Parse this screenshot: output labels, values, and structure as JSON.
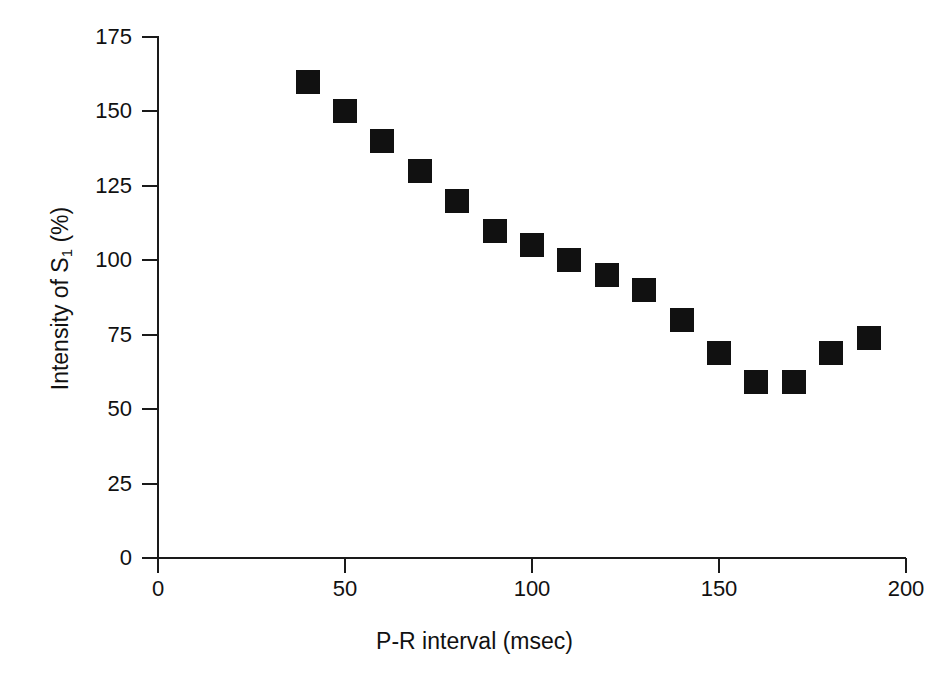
{
  "chart_data": {
    "type": "scatter",
    "title": "",
    "subtitle": "",
    "xlabel": "P-R interval (msec)",
    "ylabel": "Intensity of S1 (%)",
    "ylabel_base": "Intensity of S",
    "ylabel_sub": "1",
    "ylabel_tail": " (%)",
    "xlim": [
      0,
      200
    ],
    "ylim": [
      0,
      175
    ],
    "xticks": [
      0,
      50,
      100,
      150,
      200
    ],
    "yticks": [
      0,
      25,
      50,
      75,
      100,
      125,
      150,
      175
    ],
    "xticklabels": [
      "0",
      "50",
      "100",
      "150",
      "200"
    ],
    "yticklabels": [
      "0",
      "25",
      "50",
      "75",
      "100",
      "125",
      "150",
      "175"
    ],
    "grid": false,
    "legend": null,
    "marker_style": "filled-square",
    "marker_color": "#111111",
    "x": [
      40,
      50,
      60,
      70,
      80,
      90,
      100,
      110,
      120,
      130,
      140,
      150,
      160,
      170,
      180,
      190
    ],
    "values": [
      160,
      150,
      140,
      130,
      120,
      110,
      105,
      100,
      95,
      90,
      80,
      69,
      59,
      59,
      69,
      74
    ],
    "points": [
      {
        "x": 40,
        "y": 160
      },
      {
        "x": 50,
        "y": 150
      },
      {
        "x": 60,
        "y": 140
      },
      {
        "x": 70,
        "y": 130
      },
      {
        "x": 80,
        "y": 120
      },
      {
        "x": 90,
        "y": 110
      },
      {
        "x": 100,
        "y": 105
      },
      {
        "x": 110,
        "y": 100
      },
      {
        "x": 120,
        "y": 95
      },
      {
        "x": 130,
        "y": 90
      },
      {
        "x": 140,
        "y": 80
      },
      {
        "x": 150,
        "y": 69
      },
      {
        "x": 160,
        "y": 59
      },
      {
        "x": 170,
        "y": 59
      },
      {
        "x": 180,
        "y": 69
      },
      {
        "x": 190,
        "y": 74
      }
    ],
    "annotations": []
  },
  "colors": {
    "axis": "#1a1a1a",
    "marker": "#111111",
    "background": "#ffffff",
    "text": "#111111"
  }
}
